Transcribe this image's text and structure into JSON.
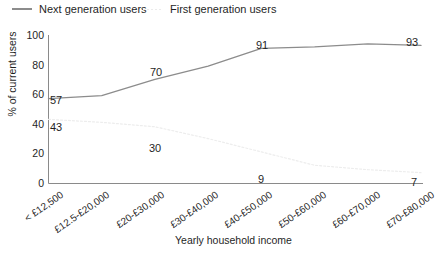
{
  "chart_data": {
    "type": "line",
    "title": "",
    "xlabel": "Yearly household income",
    "ylabel": "% of current users",
    "categories": [
      "< £12,500",
      "£12.5-£20,000",
      "£20-£30,000",
      "£30-£40,000",
      "£40-£50,000",
      "£50-£60,000",
      "£60-£70,000",
      "£70-£80,000"
    ],
    "ylim": [
      0,
      100
    ],
    "yticks": [
      "0",
      "20",
      "40",
      "60",
      "80",
      "100"
    ],
    "grid": false,
    "legend_position": "top-left",
    "series": [
      {
        "name": "Next generation users",
        "style": "solid",
        "color": "#8c8c8c",
        "values": [
          57,
          59,
          70,
          79,
          91,
          92,
          94,
          93
        ],
        "labels": [
          {
            "index": 0,
            "text": "57"
          },
          {
            "index": 2,
            "text": "70"
          },
          {
            "index": 4,
            "text": "91"
          },
          {
            "index": 7,
            "text": "93"
          }
        ]
      },
      {
        "name": "First generation users",
        "style": "dotted",
        "color": "#ededed",
        "values": [
          43,
          41,
          38,
          30,
          21,
          12,
          9,
          7
        ],
        "labels": [
          {
            "index": 0,
            "text": "43"
          },
          {
            "index": 3,
            "text": "30"
          },
          {
            "index": 5,
            "text": "9"
          },
          {
            "index": 7,
            "text": "7"
          }
        ]
      }
    ]
  },
  "legend": {
    "next_generation": "Next generation users",
    "first_generation": "First generation users"
  },
  "axes": {
    "y_title": "% of current users",
    "x_title": "Yearly household income"
  },
  "y_ticks": [
    "100",
    "80",
    "60",
    "40",
    "20",
    "0"
  ],
  "x_ticks": [
    "< £12,500",
    "£12.5-£20,000",
    "£20-£30,000",
    "£30-£40,000",
    "£40-£50,000",
    "£50-£60,000",
    "£60-£70,000",
    "£70-£80,000"
  ],
  "data_labels": {
    "next": [
      "57",
      "70",
      "91",
      "93"
    ],
    "first": [
      "43",
      "30",
      "9",
      "7"
    ]
  }
}
